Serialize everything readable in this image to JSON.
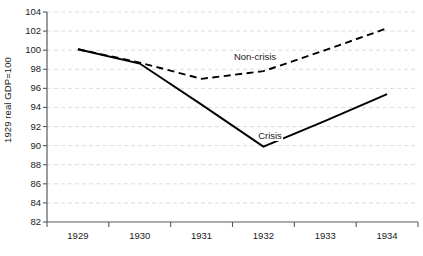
{
  "chart_data": {
    "type": "line",
    "title": "",
    "subtitle": "",
    "xlabel": "",
    "ylabel": "1929 real GDP=100",
    "categories": [
      "1929",
      "1930",
      "1931",
      "1932",
      "1933",
      "1934"
    ],
    "x": [
      1929,
      1930,
      1931,
      1932,
      1933,
      1934
    ],
    "ylim": [
      82,
      104
    ],
    "yticks": [
      82,
      84,
      86,
      88,
      90,
      92,
      94,
      96,
      98,
      100,
      102,
      104
    ],
    "ytick_labels": [
      "82",
      "84",
      "86",
      "88",
      "90",
      "92",
      "94",
      "96",
      "98",
      "100",
      "102",
      "104"
    ],
    "grid": true,
    "grid_axis": "y",
    "grid_style": "dashed",
    "grid_color": "#d9d9d9",
    "axis_color": "#595959",
    "legend": "inline-annotations",
    "legend_position": "none",
    "series": [
      {
        "name": "Non-crisis",
        "style": "dashed",
        "color": "#000000",
        "values": [
          100.1,
          98.7,
          97.0,
          97.8,
          100.0,
          102.3
        ]
      },
      {
        "name": "Crisis",
        "style": "solid",
        "color": "#000000",
        "values": [
          100.1,
          98.6,
          94.3,
          89.9,
          92.6,
          95.4
        ]
      }
    ],
    "annotations": [
      {
        "text": "Non-crisis",
        "series": "Non-crisis",
        "x_pixel": 255,
        "y_pixel": 58
      },
      {
        "text": "Crisis",
        "series": "Crisis",
        "x_pixel": 270,
        "y_pixel": 137
      }
    ]
  }
}
